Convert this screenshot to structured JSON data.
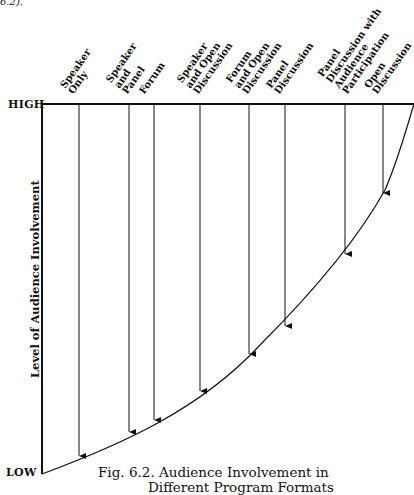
{
  "top_fragment": "6.2).",
  "axis": {
    "high_label": "HIGH",
    "low_label": "LOW",
    "y_title": "Level of Audience Involvement"
  },
  "formats": [
    {
      "label_lines": [
        "Speaker",
        "Only"
      ],
      "x": 79,
      "end_y": 456
    },
    {
      "label_lines": [
        "Speaker",
        "and",
        "Panel"
      ],
      "x": 129,
      "end_y": 432
    },
    {
      "label_lines": [
        "Forum"
      ],
      "x": 154,
      "end_y": 420
    },
    {
      "label_lines": [
        "Speaker",
        "and Open",
        "Discussion"
      ],
      "x": 200,
      "end_y": 391
    },
    {
      "label_lines": [
        "Forum",
        "and Open",
        "Discussion"
      ],
      "x": 249,
      "end_y": 354
    },
    {
      "label_lines": [
        "Panel",
        "Discussion"
      ],
      "x": 285,
      "end_y": 326
    },
    {
      "label_lines": [
        "Panel",
        "Discussion with",
        "Audience",
        "Participation"
      ],
      "x": 345,
      "end_y": 254
    },
    {
      "label_lines": [
        "Open",
        "Discussion"
      ],
      "x": 383,
      "end_y": 193
    }
  ],
  "caption": {
    "line1": "Fig. 6.2. Audience Involvement in",
    "line2": "Different Program Formats"
  },
  "colors": {
    "ink": "#111111",
    "background": "#ffffff"
  }
}
